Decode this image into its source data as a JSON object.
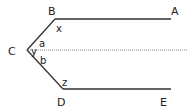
{
  "diagram": {
    "colors": {
      "line": "#333333",
      "dotted": "#888888",
      "text": "#222222",
      "background": "#ffffff"
    },
    "points": {
      "A": {
        "label": "A",
        "x": 171,
        "y": 19
      },
      "B": {
        "label": "B",
        "x": 55,
        "y": 19
      },
      "C": {
        "label": "C",
        "x": 27,
        "y": 50
      },
      "D": {
        "label": "D",
        "x": 63,
        "y": 89
      },
      "E": {
        "label": "E",
        "x": 171,
        "y": 89
      }
    },
    "segments": [
      {
        "from": "B",
        "to": "A",
        "style": "solid"
      },
      {
        "from": "C",
        "to": "B",
        "style": "solid"
      },
      {
        "from": "C",
        "to": "D",
        "style": "solid"
      },
      {
        "from": "D",
        "to": "E",
        "style": "solid"
      },
      {
        "from": "C",
        "to": "right-edge",
        "style": "dotted"
      }
    ],
    "angle_labels": {
      "x": "x",
      "a": "a",
      "y": "y",
      "b": "b",
      "z": "z"
    }
  }
}
